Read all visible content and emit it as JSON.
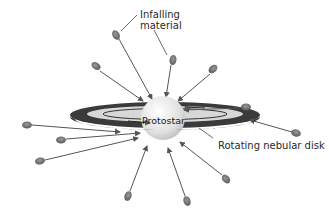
{
  "diagram": {
    "labels": {
      "infalling_line1": "Infalling",
      "infalling_line2": "material",
      "protostar": "Protostar",
      "disk": "Rotating nebular disk"
    },
    "colors": {
      "background": "#ffffff",
      "arrow": "#555555",
      "blob": "#6e6e6e",
      "disk_dark": "#3a3a3a",
      "disk_light": "#d8d8d8",
      "protostar": "#e6e6e6",
      "text": "#2a2a2a"
    },
    "center": {
      "x": 163,
      "y": 117
    },
    "infall_sources": [
      {
        "x": 116,
        "y": 34
      },
      {
        "x": 173,
        "y": 60
      },
      {
        "x": 96,
        "y": 66
      },
      {
        "x": 213,
        "y": 69
      },
      {
        "x": 246,
        "y": 107
      },
      {
        "x": 296,
        "y": 133
      },
      {
        "x": 27,
        "y": 125
      },
      {
        "x": 61,
        "y": 140
      },
      {
        "x": 40,
        "y": 161
      },
      {
        "x": 226,
        "y": 179
      },
      {
        "x": 128,
        "y": 196
      },
      {
        "x": 187,
        "y": 201
      }
    ]
  }
}
